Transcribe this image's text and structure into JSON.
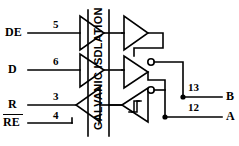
{
  "diagram": {
    "title": "GALVANIC ISDLATION",
    "barrier_label": "GALVANIC ISDLATION",
    "stroke_color": "#000000",
    "background": "#ffffff",
    "inputs": [
      {
        "name": "DE",
        "label": "DE",
        "pin": "5",
        "overbar": false
      },
      {
        "name": "D",
        "label": "D",
        "pin": "6",
        "overbar": false
      },
      {
        "name": "R",
        "label": "R",
        "pin": "3",
        "overbar": false
      },
      {
        "name": "RE",
        "label": "RE",
        "pin": "4",
        "overbar": true
      }
    ],
    "outputs": [
      {
        "name": "B",
        "label": "B",
        "pin": "13"
      },
      {
        "name": "A",
        "label": "A",
        "pin": "12"
      }
    ],
    "gates": [
      {
        "name": "de-buffer",
        "type": "buffer",
        "inverting": false,
        "side": "left"
      },
      {
        "name": "d-buffer",
        "type": "buffer",
        "inverting": false,
        "side": "left"
      },
      {
        "name": "re-buffer",
        "type": "buffer",
        "inverting": true,
        "side": "left"
      },
      {
        "name": "enable-buffer",
        "type": "buffer",
        "inverting": false,
        "side": "right"
      },
      {
        "name": "driver-buffer",
        "type": "buffer",
        "inverting": true,
        "side": "right"
      },
      {
        "name": "receiver-schmitt",
        "type": "schmitt-trigger",
        "inverting": true,
        "side": "right"
      }
    ]
  }
}
